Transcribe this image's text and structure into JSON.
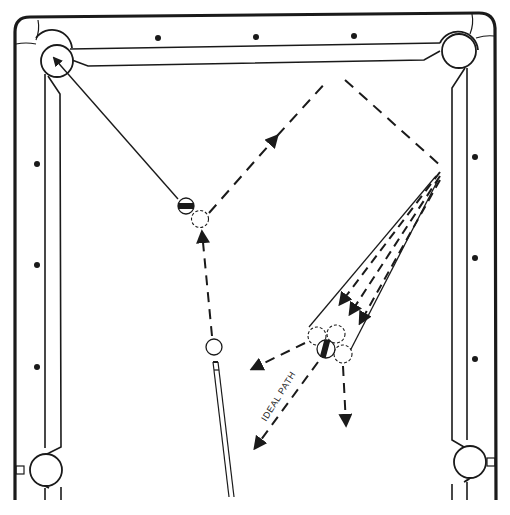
{
  "diagram": {
    "type": "billiards-shot-diagram",
    "colors": {
      "ink": "#1a1a1a",
      "background": "#ffffff"
    },
    "annotations": {
      "ideal_path_label": "IDEAL PATH"
    },
    "table": {
      "pockets": [
        "top-left-corner",
        "top-right-corner",
        "bottom-left-side",
        "bottom-right-side"
      ],
      "diamonds": {
        "top": 3,
        "left": 3,
        "right": 3
      }
    },
    "balls": {
      "cue_ball": "cue-ball",
      "object_ball": "striped-object-ball",
      "ghost_ball": "ghost-ball-contact-position",
      "cluster_ball": "striped-cluster-ball",
      "cluster_ghost_balls": 3
    },
    "paths": {
      "cue_path": "dashed-with-arrow",
      "object_ball_path": "solid-line-to-top-left-pocket",
      "bank_path": "dashed two-rail bank with arrow",
      "fan": "three dashed arrows within a cone converging on cluster",
      "deflections": [
        "left",
        "ideal-path",
        "down"
      ]
    }
  }
}
